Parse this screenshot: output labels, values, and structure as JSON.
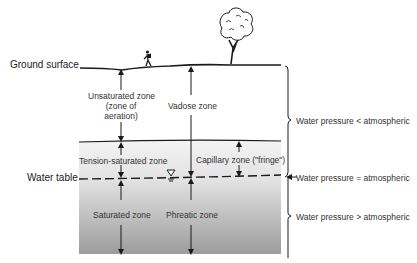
{
  "figure": {
    "type": "groundwater-zones-cross-section",
    "left_labels": {
      "ground_surface": "Ground surface",
      "water_table": "Water table"
    },
    "zones": {
      "unsaturated": [
        "Unsaturated zone",
        "(zone of",
        "aeration)"
      ],
      "vadose": "Vadose zone",
      "tension_saturated": "Tension-saturated zone",
      "capillary": "Capillary zone (\"fringe\")",
      "saturated": "Saturated zone",
      "phreatic": "Phreatic zone"
    },
    "pressure_labels": {
      "above": "Water pressure < atmospheric",
      "at": "Water pressure = atmospheric",
      "below": "Water pressure > atmospheric"
    },
    "icons": [
      "hiker-icon",
      "tree-icon",
      "water-table-symbol-icon"
    ],
    "colors": {
      "soil_gradient_top": "#f2f2f2",
      "soil_gradient_bottom": "#9a9a9a",
      "line": "#1a1a1a"
    }
  }
}
